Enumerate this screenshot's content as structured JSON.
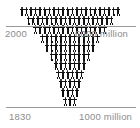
{
  "chart_data": {
    "type": "bar",
    "title": "",
    "subtitle": "",
    "xlabel": "",
    "ylabel": "",
    "orientation": "inverted-pyramid",
    "unit_note": "each pictogram represents a unit of world population",
    "categories": [
      "2000",
      "1980",
      "1960",
      "1940",
      "1920",
      "1900",
      "1880",
      "1860",
      "1850",
      "1840",
      "1830"
    ],
    "values": [
      22,
      19,
      16,
      13,
      11,
      9,
      7,
      6,
      5,
      4,
      3
    ],
    "series": [
      {
        "name": "World population (pictogram rows)",
        "values": [
          22,
          19,
          16,
          13,
          11,
          9,
          7,
          6,
          5,
          4,
          3
        ]
      }
    ],
    "rows": [
      {
        "index": 0,
        "count": 22
      },
      {
        "index": 1,
        "count": 19
      },
      {
        "index": 2,
        "count": 16
      },
      {
        "index": 3,
        "count": 13
      },
      {
        "index": 4,
        "count": 11
      },
      {
        "index": 5,
        "count": 9
      },
      {
        "index": 6,
        "count": 7
      },
      {
        "index": 7,
        "count": 6
      },
      {
        "index": 8,
        "count": 5
      },
      {
        "index": 9,
        "count": 4
      },
      {
        "index": 10,
        "count": 3
      }
    ],
    "annotations": [
      {
        "id": "top-left",
        "text": "2000",
        "position": "top-left"
      },
      {
        "id": "top-right",
        "text": "6000 million",
        "position": "top-right"
      },
      {
        "id": "bottom-left",
        "text": "1830",
        "position": "bottom-left"
      },
      {
        "id": "bottom-right",
        "text": "1000 million",
        "position": "bottom-right"
      }
    ],
    "axis_ranges": {
      "top_value": "6000 million",
      "bottom_value": "1000 million",
      "top_year": "2000",
      "bottom_year": "1830"
    },
    "grid": false,
    "legend": "none",
    "colors": {
      "figure": "#111111",
      "rule": "#9a9a9a",
      "label": "#8c8c8c",
      "background": "#ffffff"
    }
  },
  "labels": {
    "top_left": "2000",
    "top_right": "6000 million",
    "bottom_left": "1830",
    "bottom_right": "1000 million"
  }
}
